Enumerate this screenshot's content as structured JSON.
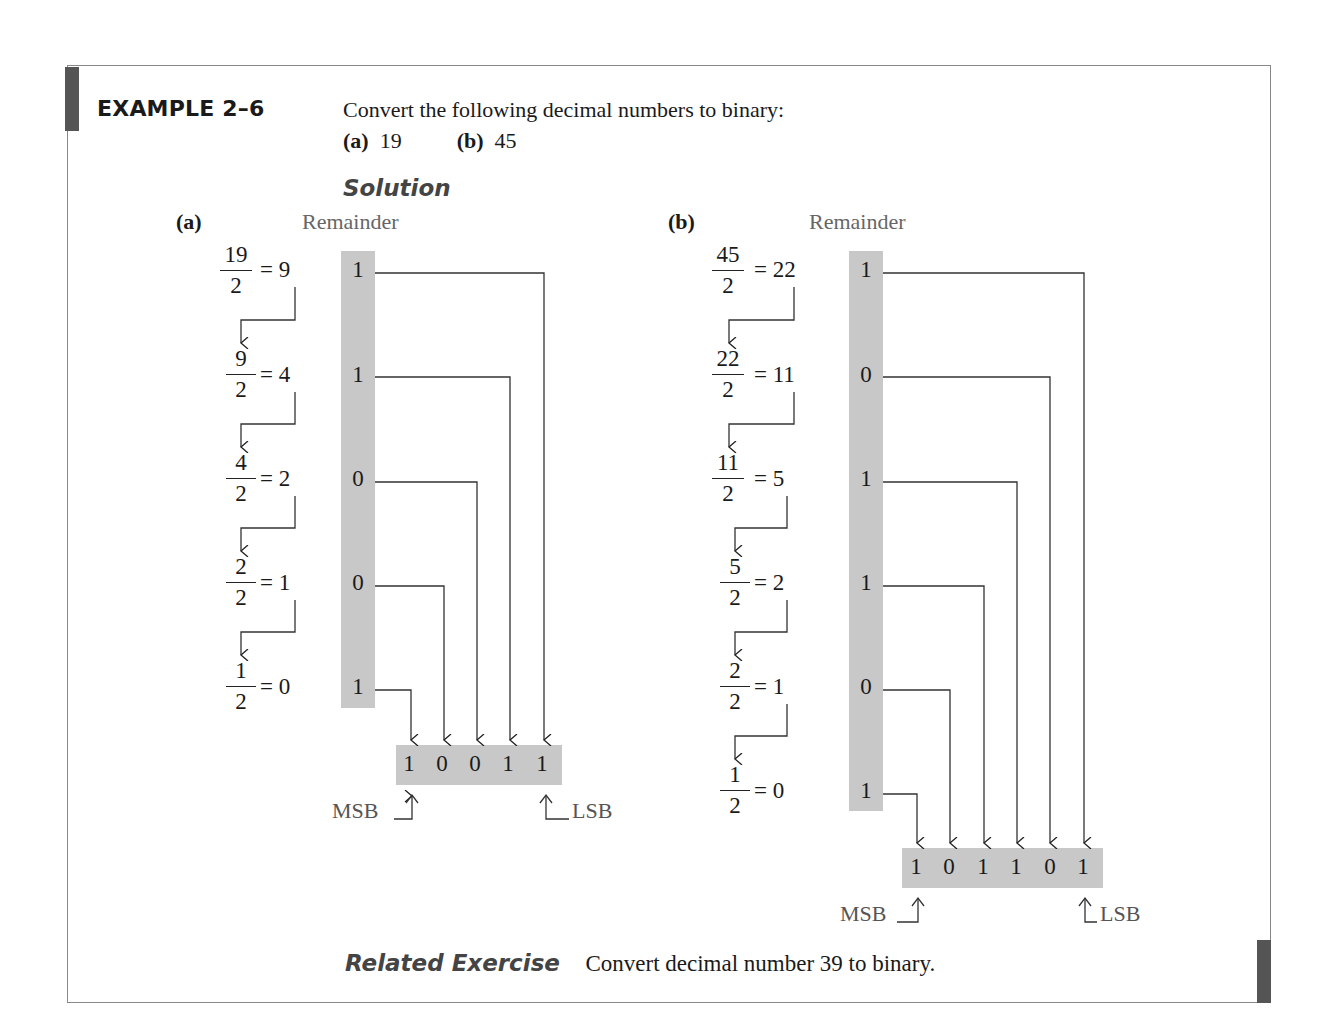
{
  "example": {
    "title": "EXAMPLE 2–6",
    "prompt": "Convert the following decimal numbers to binary:",
    "parts": [
      {
        "label": "(a)",
        "value": "19"
      },
      {
        "label": "(b)",
        "value": "45"
      }
    ],
    "solution_label": "Solution"
  },
  "part_a": {
    "label": "(a)",
    "remainder_label": "Remainder",
    "steps": [
      {
        "num": "19",
        "den": "2",
        "result": "= 9",
        "remainder": "1"
      },
      {
        "num": "9",
        "den": "2",
        "result": "= 4",
        "remainder": "1"
      },
      {
        "num": "4",
        "den": "2",
        "result": "= 2",
        "remainder": "0"
      },
      {
        "num": "2",
        "den": "2",
        "result": "= 1",
        "remainder": "0"
      },
      {
        "num": "1",
        "den": "2",
        "result": "= 0",
        "remainder": "1"
      }
    ],
    "result_bits": [
      "1",
      "0",
      "0",
      "1",
      "1"
    ],
    "msb_label": "MSB",
    "lsb_label": "LSB"
  },
  "part_b": {
    "label": "(b)",
    "remainder_label": "Remainder",
    "steps": [
      {
        "num": "45",
        "den": "2",
        "result": "= 22",
        "remainder": "1"
      },
      {
        "num": "22",
        "den": "2",
        "result": "= 11",
        "remainder": "0"
      },
      {
        "num": "11",
        "den": "2",
        "result": "= 5",
        "remainder": "1"
      },
      {
        "num": "5",
        "den": "2",
        "result": "= 2",
        "remainder": "1"
      },
      {
        "num": "2",
        "den": "2",
        "result": "= 1",
        "remainder": "0"
      },
      {
        "num": "1",
        "den": "2",
        "result": "= 0",
        "remainder": "1"
      }
    ],
    "result_bits": [
      "1",
      "0",
      "1",
      "1",
      "0",
      "1"
    ],
    "msb_label": "MSB",
    "lsb_label": "LSB"
  },
  "related": {
    "label": "Related Exercise",
    "text": "Convert decimal number 39 to binary."
  }
}
